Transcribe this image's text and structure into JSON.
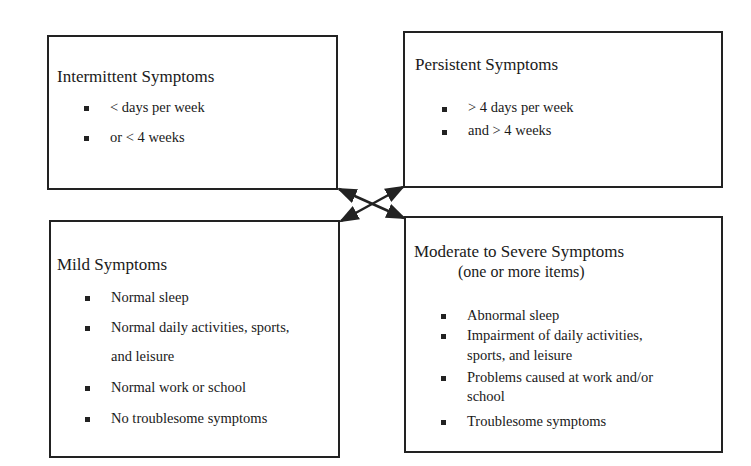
{
  "diagram": {
    "boxes": {
      "intermittent": {
        "title": "Intermittent Symptoms",
        "items": [
          "< days per week",
          "or < 4 weeks"
        ]
      },
      "persistent": {
        "title": "Persistent Symptoms",
        "items": [
          "> 4 days per week",
          "and > 4 weeks"
        ]
      },
      "mild": {
        "title": "Mild Symptoms",
        "items": [
          "Normal sleep",
          "Normal daily activities, sports,",
          "and leisure",
          "Normal work or school",
          "No troublesome symptoms"
        ]
      },
      "moderate": {
        "title": "Moderate to Severe Symptoms",
        "subtitle": "(one or more items)",
        "items": [
          "Abnormal sleep",
          "Impairment of daily activities,",
          "sports, and leisure",
          "Problems caused at work and/or",
          "school",
          "Troublesome symptoms"
        ]
      }
    },
    "connectors": [
      {
        "from": "intermittent",
        "to": "moderate",
        "style": "double-arrow"
      },
      {
        "from": "persistent",
        "to": "mild",
        "style": "double-arrow"
      }
    ],
    "colors": {
      "line": "#222222",
      "background": "#ffffff",
      "text": "#1a1a1a"
    }
  }
}
